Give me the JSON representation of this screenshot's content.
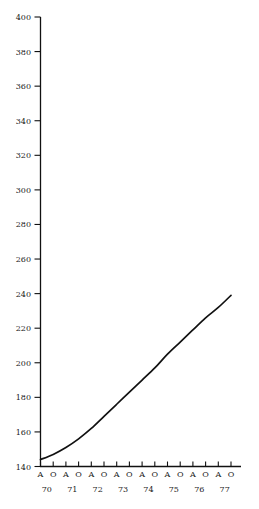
{
  "chart_data": {
    "type": "line",
    "title": "",
    "subtitle": "",
    "xlabel": "",
    "ylabel": "",
    "ylim": [
      140,
      400
    ],
    "xlim": [
      0,
      15
    ],
    "grid": false,
    "legend": null,
    "y_ticks": [
      140,
      160,
      180,
      200,
      220,
      240,
      260,
      280,
      300,
      320,
      340,
      360,
      380,
      400
    ],
    "x_tick_labels": [
      "A",
      "O",
      "A",
      "O",
      "A",
      "O",
      "A",
      "O",
      "A",
      "O",
      "A",
      "O",
      "A",
      "O",
      "A",
      "O"
    ],
    "x_year_labels": [
      "70",
      "71",
      "72",
      "73",
      "74",
      "75",
      "76",
      "77"
    ],
    "series": [
      {
        "name": "series-1",
        "color": "#111111",
        "x": [
          0,
          1,
          2,
          3,
          4,
          5,
          6,
          7,
          8,
          9,
          10,
          11,
          12,
          13,
          14,
          15
        ],
        "values": [
          144,
          147,
          151,
          156,
          162,
          169,
          176,
          183,
          190,
          197,
          205,
          212,
          219,
          226,
          232,
          239
        ]
      }
    ]
  },
  "axes": {
    "y_axis_name": "y-axis",
    "x_axis_name": "x-axis"
  }
}
